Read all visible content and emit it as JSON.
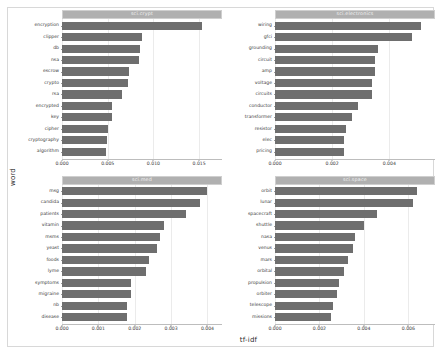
{
  "chart_data": {
    "type": "bar",
    "orientation": "horizontal",
    "title": "",
    "xlabel": "tf-idf",
    "ylabel": "word",
    "grid": true,
    "legend": "none",
    "bar_color": "#6e6e6e",
    "strip_color": "#b0b0b0",
    "facets": [
      {
        "name": "sci.crypt",
        "position": "top-left",
        "xlim": [
          0,
          0.0175
        ],
        "xticks": [
          "0.000",
          "0.005",
          "0.010",
          "0.015"
        ],
        "xtick_values": [
          0.0,
          0.005,
          0.01,
          0.015
        ],
        "categories": [
          "encryption",
          "clipper",
          "db",
          "nsa",
          "escrow",
          "crypto",
          "rsa",
          "encrypted",
          "key",
          "cipher",
          "cryptography",
          "algorithm"
        ],
        "values": [
          0.0153,
          0.0087,
          0.0085,
          0.0084,
          0.0073,
          0.0072,
          0.0066,
          0.0055,
          0.0055,
          0.005,
          0.0049,
          0.0048
        ]
      },
      {
        "name": "sci.electronics",
        "position": "top-right",
        "xlim": [
          0,
          0.0056
        ],
        "xticks": [
          "0.000",
          "0.002",
          "0.004"
        ],
        "xtick_values": [
          0.0,
          0.002,
          0.004
        ],
        "categories": [
          "wiring",
          "gfci",
          "grounding",
          "circuit",
          "amp",
          "voltage",
          "circuits",
          "conductor",
          "transformer",
          "resistor",
          "elec",
          "pricing"
        ],
        "values": [
          0.0051,
          0.0048,
          0.0036,
          0.0035,
          0.0035,
          0.0034,
          0.0034,
          0.0029,
          0.0027,
          0.0025,
          0.0024,
          0.0024
        ]
      },
      {
        "name": "sci.med",
        "position": "bottom-left",
        "xlim": [
          0,
          0.0044
        ],
        "xticks": [
          "0.000",
          "0.001",
          "0.002",
          "0.003",
          "0.004"
        ],
        "xtick_values": [
          0.0,
          0.001,
          0.002,
          0.003,
          0.004
        ],
        "categories": [
          "msg",
          "candida",
          "patients",
          "vitamin",
          "msms",
          "yeast",
          "foods",
          "lyme",
          "symptoms",
          "migraine",
          "nb",
          "disease"
        ],
        "values": [
          0.004,
          0.0038,
          0.0034,
          0.0028,
          0.0027,
          0.0026,
          0.0024,
          0.0023,
          0.0019,
          0.0019,
          0.0018,
          0.0018
        ]
      },
      {
        "name": "sci.space",
        "position": "bottom-right",
        "xlim": [
          0,
          0.0072
        ],
        "xticks": [
          "0.000",
          "0.002",
          "0.004",
          "0.006"
        ],
        "xtick_values": [
          0.0,
          0.002,
          0.004,
          0.006
        ],
        "categories": [
          "orbit",
          "lunar",
          "spacecraft",
          "shuttle",
          "nasa",
          "venus",
          "mars",
          "orbital",
          "propulsion",
          "orbiter",
          "telescope",
          "missions"
        ],
        "values": [
          0.0064,
          0.0062,
          0.0046,
          0.004,
          0.0036,
          0.0035,
          0.0033,
          0.0031,
          0.0029,
          0.0028,
          0.0026,
          0.0025
        ]
      }
    ]
  }
}
